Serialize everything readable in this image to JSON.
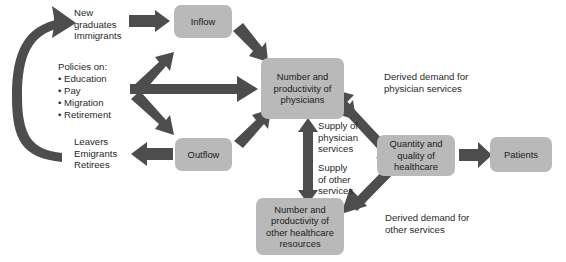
{
  "diagram": {
    "colors": {
      "node_fill": "#b9b9b9",
      "arrow": "#4d4d4d",
      "text": "#2a2a2a"
    },
    "nodes": [
      {
        "id": "inflow",
        "label": "Inflow"
      },
      {
        "id": "outflow",
        "label": "Outflow"
      },
      {
        "id": "physicians",
        "label": "Number and\nproductivity of\nphysicians"
      },
      {
        "id": "other",
        "label": "Number and\nproductivity of\nother healthcare\nresources"
      },
      {
        "id": "quality",
        "label": "Quantity and\nquality of healthcare"
      },
      {
        "id": "patients",
        "label": "Patients"
      }
    ],
    "labels": [
      {
        "id": "new-graduates",
        "text": "New\ngraduates\nImmigrants"
      },
      {
        "id": "policies-title",
        "text": "Policies on:"
      },
      {
        "id": "policies-list",
        "text": "• Education\n• Pay\n• Migration\n• Retirement"
      },
      {
        "id": "leavers",
        "text": "Leavers\nEmigrants\nRetirees"
      },
      {
        "id": "supply-physician",
        "text": "Supply of\nphysician\nservices"
      },
      {
        "id": "supply-other",
        "text": "Supply\nof other\nservices"
      },
      {
        "id": "derived-physician",
        "text": "Derived demand for\nphysician services"
      },
      {
        "id": "derived-other",
        "text": "Derived demand for\nother services"
      }
    ],
    "arrows": [
      {
        "id": "feedback-loop",
        "from": "leavers",
        "to": "new-graduates",
        "style": "curved"
      },
      {
        "id": "graduates-to-inflow",
        "from": "new-graduates",
        "to": "inflow",
        "style": "straight"
      },
      {
        "id": "inflow-to-physicians",
        "from": "inflow",
        "to": "physicians",
        "style": "straight"
      },
      {
        "id": "policies-to-inflow",
        "from": "policies",
        "to": "inflow",
        "style": "straight"
      },
      {
        "id": "policies-to-physicians",
        "from": "policies",
        "to": "physicians",
        "style": "straight"
      },
      {
        "id": "policies-to-outflow",
        "from": "policies",
        "to": "outflow",
        "style": "straight"
      },
      {
        "id": "outflow-to-leavers",
        "from": "outflow",
        "to": "leavers",
        "style": "straight"
      },
      {
        "id": "outflow-to-physicians",
        "from": "outflow",
        "to": "physicians",
        "style": "straight"
      },
      {
        "id": "physicians-quality",
        "from": "physicians",
        "to": "quality",
        "style": "double"
      },
      {
        "id": "other-quality",
        "from": "other",
        "to": "quality",
        "style": "double"
      },
      {
        "id": "physicians-other-supply",
        "from": "physicians",
        "to": "other",
        "style": "double-vertical"
      },
      {
        "id": "quality-to-patients",
        "from": "quality",
        "to": "patients",
        "style": "straight"
      }
    ]
  }
}
